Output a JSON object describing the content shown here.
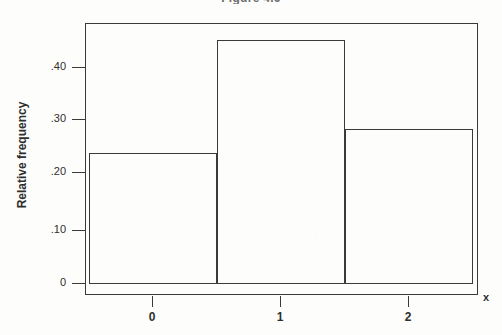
{
  "figure": {
    "title": "Figure 4.6",
    "background_color": "#fdfdfb",
    "line_color": "#3a3a3a",
    "bar_fill": "none"
  },
  "chart_data": {
    "type": "bar",
    "title": "Figure 4.6",
    "xlabel": "x",
    "ylabel": "Relative frequency",
    "categories": [
      "0",
      "1",
      "2"
    ],
    "values": [
      0.25,
      0.465,
      0.295
    ],
    "bin_edges": [
      -0.5,
      0.5,
      1.5,
      2.5
    ],
    "xlim": [
      -0.62,
      2.62
    ],
    "ylim": [
      0,
      0.52
    ],
    "x_ticks": [
      "0",
      "1",
      "2"
    ],
    "x_tick_values": [
      0,
      1,
      2
    ],
    "y_ticks": [
      "0",
      ".10",
      ".20",
      ".30",
      ".40"
    ],
    "y_tick_values": [
      0,
      0.1,
      0.2,
      0.3,
      0.4
    ],
    "grid": false,
    "legend": false,
    "series": [
      {
        "name": "Relative frequency",
        "values": [
          0.25,
          0.465,
          0.295
        ]
      }
    ]
  },
  "axes": {
    "y_title": "Relative frequency",
    "x_title": "x",
    "y_ticks": [
      {
        "label": ".40",
        "value": 0.4
      },
      {
        "label": ".30",
        "value": 0.3
      },
      {
        "label": ".20",
        "value": 0.2
      },
      {
        "label": ".10",
        "value": 0.1
      },
      {
        "label": "0",
        "value": 0
      }
    ],
    "x_ticks": [
      {
        "label": "0",
        "value": 0
      },
      {
        "label": "1",
        "value": 1
      },
      {
        "label": "2",
        "value": 2
      }
    ]
  },
  "bars": [
    {
      "name": "bar-0",
      "category": "0",
      "value": 0.25,
      "left": -0.5,
      "right": 0.5
    },
    {
      "name": "bar-1",
      "category": "1",
      "value": 0.465,
      "left": 0.5,
      "right": 1.5
    },
    {
      "name": "bar-2",
      "category": "2",
      "value": 0.295,
      "left": 1.5,
      "right": 2.5
    }
  ]
}
